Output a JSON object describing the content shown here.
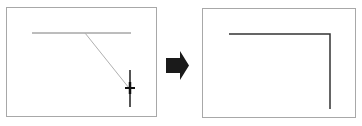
{
  "diagram": {
    "colors": {
      "frame_border": "#a8a8a8",
      "guide_line": "#7a7a7a",
      "rubber_band_line": "#b0b0b0",
      "result_line": "#333333",
      "arrow": "#1a1a1a",
      "cursor": "#111111"
    },
    "before_panel": {
      "frame": {
        "x": 6,
        "y": 7,
        "w": 151,
        "h": 110
      },
      "horizontal_line": {
        "x1": 32,
        "y1": 33,
        "x2": 131,
        "y2": 33
      },
      "diagonal_line": {
        "x1": 85,
        "y1": 33,
        "x2": 129,
        "y2": 88
      },
      "vertical_line": {
        "x1": 130,
        "y1": 70,
        "x2": 130,
        "y2": 107
      },
      "cursor": {
        "icon": "crosshair-icon",
        "x": 130,
        "y": 88
      }
    },
    "transition_arrow": {
      "icon": "right-arrow-icon",
      "x": 166,
      "y": 51,
      "w": 23,
      "h": 29
    },
    "after_panel": {
      "frame": {
        "x": 202,
        "y": 8,
        "w": 154,
        "h": 110
      },
      "corner_path": {
        "start": [
          229,
          34
        ],
        "corner": [
          330,
          34
        ],
        "end": [
          330,
          109
        ]
      }
    }
  }
}
